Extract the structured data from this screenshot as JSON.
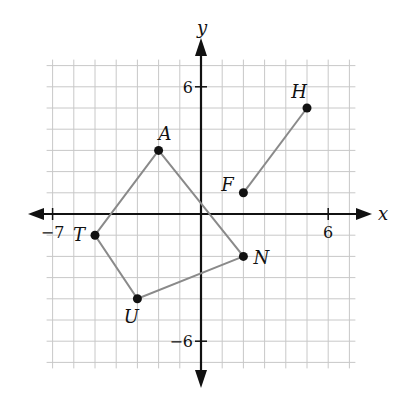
{
  "diagram": {
    "type": "coordinate-plane",
    "axes": {
      "x_label": "x",
      "y_label": "y",
      "x_range": [
        -7,
        7
      ],
      "y_range": [
        -7,
        7
      ],
      "x_tick_labels": [
        {
          "value": -7,
          "text": "−7"
        },
        {
          "value": 6,
          "text": "6"
        }
      ],
      "y_tick_labels": [
        {
          "value": 6,
          "text": "6"
        },
        {
          "value": -6,
          "text": "−6"
        }
      ]
    },
    "grid": {
      "step": 1,
      "color": "#c8c8c8"
    },
    "colors": {
      "axis": "#111111",
      "segment": "#8a8a8a",
      "point": "#111111"
    },
    "points": [
      {
        "name": "A",
        "x": -2,
        "y": 3,
        "label_dx": 0,
        "label_dy": -10
      },
      {
        "name": "T",
        "x": -5,
        "y": -1,
        "label_dx": -16,
        "label_dy": 6
      },
      {
        "name": "U",
        "x": -3,
        "y": -4,
        "label_dx": -6,
        "label_dy": 24
      },
      {
        "name": "N",
        "x": 2,
        "y": -2,
        "label_dx": 10,
        "label_dy": 8
      },
      {
        "name": "F",
        "x": 2,
        "y": 1,
        "label_dx": -16,
        "label_dy": -2
      },
      {
        "name": "H",
        "x": 5,
        "y": 5,
        "label_dx": -8,
        "label_dy": -10
      }
    ],
    "polygon": {
      "name": "TANU",
      "vertices": [
        "T",
        "A",
        "N",
        "U"
      ]
    },
    "segments": [
      {
        "name": "FH",
        "from": "F",
        "to": "H"
      }
    ]
  }
}
